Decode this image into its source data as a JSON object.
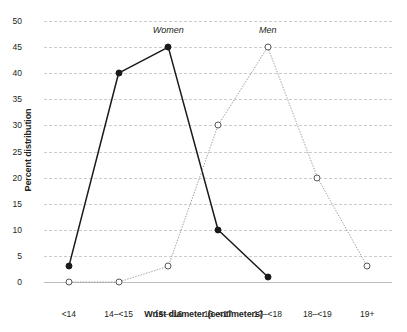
{
  "chart_data": {
    "type": "line",
    "title": "",
    "xlabel": "Wrist diameter (centimeters)",
    "ylabel": "Percent distribution",
    "categories": [
      "<14",
      "14–<15",
      "15–<16",
      "16–<17",
      "17–<18",
      "18–<19",
      "19+"
    ],
    "yticks": [
      0,
      5,
      10,
      15,
      20,
      25,
      30,
      35,
      40,
      45,
      50
    ],
    "ylim": [
      0,
      50
    ],
    "grid": true,
    "legend_position": "inline-annotation",
    "series": [
      {
        "name": "Women",
        "values": [
          3,
          40,
          45,
          10,
          1,
          null,
          null
        ],
        "color": "#1a1a1a",
        "line_style": "solid",
        "marker": "filled-circle",
        "label_category": "15–<16",
        "label_value": 45
      },
      {
        "name": "Men",
        "values": [
          0,
          0,
          3,
          30,
          45,
          20,
          3
        ],
        "color": "#9a9ea3",
        "line_style": "dotted",
        "marker": "hollow-circle",
        "label_category": "17–<18",
        "label_value": 45
      }
    ]
  },
  "style": {
    "background": "#ffffff",
    "gridline_color": "#c9cdd2",
    "axis_color": "#b9bcc0",
    "text_color": "#231f20"
  }
}
